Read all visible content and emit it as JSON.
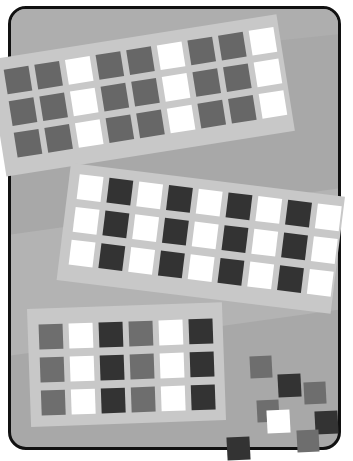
{
  "colors": {
    "background": "#ffffff",
    "board": "#a8a8a8",
    "board_border": "#111111",
    "card": "#c9c9c9",
    "white": "#ffffff",
    "gray": "#676767",
    "mid": "#6e6e6e",
    "dark": "#333333"
  },
  "cards": [
    {
      "name": "top-card",
      "rows": 3,
      "cols": 9,
      "pattern": [
        "gray",
        "gray",
        "white",
        "gray",
        "gray",
        "white",
        "gray",
        "gray",
        "white"
      ]
    },
    {
      "name": "middle-card",
      "rows": 3,
      "cols": 8,
      "pattern": [
        "white",
        "dark",
        "white",
        "dark",
        "white",
        "dark",
        "white",
        "dark",
        "white"
      ]
    },
    {
      "name": "bottom-card",
      "rows": 3,
      "cols": 6,
      "pattern": [
        "mid",
        "white",
        "dark",
        "mid",
        "white",
        "dark"
      ]
    }
  ],
  "scattered_squares": [
    {
      "x": 250,
      "y": 356,
      "size": 22,
      "color": "mid"
    },
    {
      "x": 278,
      "y": 374,
      "size": 23,
      "color": "dark"
    },
    {
      "x": 304,
      "y": 382,
      "size": 22,
      "color": "mid"
    },
    {
      "x": 257,
      "y": 400,
      "size": 22,
      "color": "mid"
    },
    {
      "x": 267,
      "y": 410,
      "size": 23,
      "color": "white"
    },
    {
      "x": 315,
      "y": 411,
      "size": 23,
      "color": "dark"
    },
    {
      "x": 297,
      "y": 430,
      "size": 22,
      "color": "mid"
    },
    {
      "x": 227,
      "y": 437,
      "size": 23,
      "color": "dark"
    }
  ]
}
